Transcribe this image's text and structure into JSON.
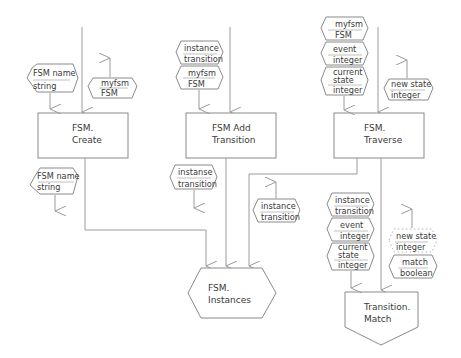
{
  "diagram": {
    "processes": [
      {
        "id": "create",
        "line1": "FSM.",
        "line2": "Create"
      },
      {
        "id": "add",
        "line1": "FSM Add",
        "line2": "Transition"
      },
      {
        "id": "traverse",
        "line1": "FSM.",
        "line2": "Traverse"
      },
      {
        "id": "match",
        "line1": "Transition.",
        "line2": "Match"
      }
    ],
    "store": {
      "id": "instances",
      "line1": "FSM.",
      "line2": "Instances"
    },
    "params": {
      "create_in": {
        "name": "FSM name",
        "type": "string"
      },
      "create_out": {
        "name": "myfsm",
        "type": "FSM"
      },
      "create_below": {
        "name": "FSM name",
        "type": "string"
      },
      "add_in_1": {
        "name": "instance",
        "type": "transition"
      },
      "add_in_2": {
        "name": "myfsm",
        "type": "FSM"
      },
      "add_below": {
        "name": "instanse",
        "type": "transition"
      },
      "traverse_in_1": {
        "name": "myfsm",
        "type": "FSM"
      },
      "traverse_in_2": {
        "name": "event",
        "type": "integer"
      },
      "traverse_in_3": {
        "name1": "current",
        "name2": "state",
        "type": "integer"
      },
      "traverse_out": {
        "name": "new state",
        "type": "integer"
      },
      "traverse_below": {
        "name": "instance",
        "type": "transition"
      },
      "match_in_1": {
        "name": "instance",
        "type": "transition"
      },
      "match_in_2": {
        "name": "event",
        "type": "integer"
      },
      "match_in_3": {
        "name1": "current",
        "name2": "state",
        "type": "integer"
      },
      "match_out_1": {
        "name": "new state",
        "type": "integer"
      },
      "match_out_2": {
        "name": "match",
        "type": "boolean"
      }
    }
  }
}
